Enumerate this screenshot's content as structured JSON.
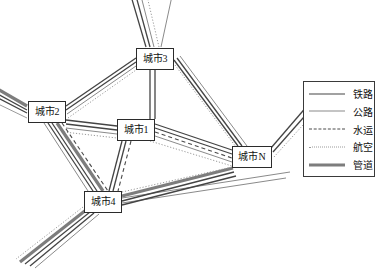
{
  "diagram": {
    "nodes": [
      {
        "id": "city3",
        "label": "城市3",
        "x": 136,
        "y": 48,
        "w": 38,
        "h": 22
      },
      {
        "id": "city2",
        "label": "城市2",
        "x": 28,
        "y": 101,
        "w": 38,
        "h": 22
      },
      {
        "id": "city1",
        "label": "城市1",
        "x": 117,
        "y": 119,
        "w": 38,
        "h": 22
      },
      {
        "id": "cityN",
        "label": "城市N",
        "x": 232,
        "y": 146,
        "w": 40,
        "h": 22
      },
      {
        "id": "city4",
        "label": "城市4",
        "x": 84,
        "y": 191,
        "w": 38,
        "h": 22
      }
    ],
    "edges": [
      {
        "from": "city2",
        "to": "city3",
        "modes": [
          "railway",
          "highway",
          "air"
        ]
      },
      {
        "from": "city2",
        "to": "city1",
        "modes": [
          "railway",
          "highway",
          "air"
        ]
      },
      {
        "from": "city2",
        "to": "city4",
        "modes": [
          "railway",
          "highway",
          "water",
          "pipeline"
        ]
      },
      {
        "from": "city3",
        "to": "city1",
        "modes": [
          "railway",
          "highway"
        ]
      },
      {
        "from": "city3",
        "to": "cityN",
        "modes": [
          "railway",
          "highway",
          "air"
        ]
      },
      {
        "from": "city1",
        "to": "cityN",
        "modes": [
          "railway",
          "highway",
          "water",
          "air"
        ]
      },
      {
        "from": "city1",
        "to": "city4",
        "modes": [
          "railway",
          "highway",
          "water"
        ]
      },
      {
        "from": "city4",
        "to": "cityN",
        "modes": [
          "railway",
          "highway",
          "air",
          "pipeline"
        ]
      },
      {
        "from": "city2",
        "to": "edge-left",
        "modes": [
          "railway",
          "highway",
          "pipeline"
        ]
      },
      {
        "from": "city3",
        "to": "edge-top",
        "modes": [
          "railway",
          "highway",
          "air"
        ]
      },
      {
        "from": "cityN",
        "to": "edge-right",
        "modes": [
          "railway",
          "highway",
          "air"
        ]
      },
      {
        "from": "city4",
        "to": "edge-bottom-left",
        "modes": [
          "railway",
          "highway",
          "air",
          "pipeline"
        ]
      }
    ]
  },
  "legend": {
    "items": [
      {
        "key": "railway",
        "label": "铁路",
        "style": "solid-medium",
        "color": "#444444"
      },
      {
        "key": "highway",
        "label": "公路",
        "style": "solid-thin",
        "color": "#8a8a8a"
      },
      {
        "key": "water",
        "label": "水运",
        "style": "dashed",
        "color": "#4a4a4a"
      },
      {
        "key": "air",
        "label": "航空",
        "style": "dotted",
        "color": "#9a9a9a"
      },
      {
        "key": "pipeline",
        "label": "管道",
        "style": "solid-thick",
        "color": "#7d7d7d"
      }
    ],
    "box": {
      "x": 303,
      "y": 81,
      "w": 72,
      "h": 96
    }
  }
}
